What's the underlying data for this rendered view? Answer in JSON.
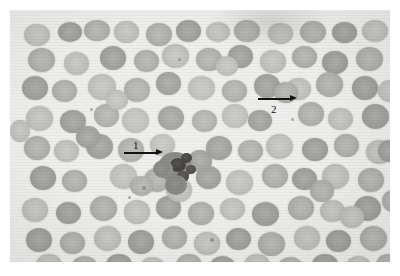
{
  "figure": {
    "kind": "light-micrograph",
    "background_color": "#ffffff",
    "plate": {
      "background_color": "#eeeeec",
      "x": 10,
      "y": 10,
      "width": 380,
      "height": 252
    }
  },
  "annotations": [
    {
      "id": "annotation-1",
      "label": "1",
      "arrow_direction": "right",
      "label_x": 133,
      "label_y": 140,
      "shaft_x": 124,
      "shaft_y": 152,
      "shaft_length": 33,
      "points_to": "dark stained cell cluster"
    },
    {
      "id": "annotation-2",
      "label": "2",
      "arrow_direction": "right",
      "label_x": 271,
      "label_y": 104,
      "shaft_x": 258,
      "shaft_y": 98,
      "shaft_length": 33,
      "points_to": "red blood cell"
    }
  ],
  "cells": {
    "erythrocyte_fill": "#b3b3af",
    "erythrocyte_pale_fill": "#c2c2be",
    "erythrocyte_dark_fill": "#a2a29e",
    "stained_cluster_fill": "#3b3937",
    "count_visible": 118,
    "erythrocytes": [
      {
        "x": 14,
        "y": 14,
        "w": 26,
        "h": 22,
        "v": "pale"
      },
      {
        "x": 48,
        "y": 12,
        "w": 24,
        "h": 20,
        "v": "dark"
      },
      {
        "x": 74,
        "y": 10,
        "w": 26,
        "h": 21,
        "v": ""
      },
      {
        "x": 104,
        "y": 11,
        "w": 25,
        "h": 22,
        "v": "pale"
      },
      {
        "x": 136,
        "y": 13,
        "w": 26,
        "h": 23,
        "v": ""
      },
      {
        "x": 166,
        "y": 10,
        "w": 25,
        "h": 22,
        "v": "dark"
      },
      {
        "x": 196,
        "y": 12,
        "w": 24,
        "h": 20,
        "v": "pale"
      },
      {
        "x": 224,
        "y": 10,
        "w": 26,
        "h": 22,
        "v": ""
      },
      {
        "x": 258,
        "y": 13,
        "w": 25,
        "h": 21,
        "v": "pale"
      },
      {
        "x": 290,
        "y": 11,
        "w": 26,
        "h": 22,
        "v": ""
      },
      {
        "x": 322,
        "y": 12,
        "w": 25,
        "h": 21,
        "v": "dark"
      },
      {
        "x": 352,
        "y": 10,
        "w": 26,
        "h": 22,
        "v": "pale"
      },
      {
        "x": 18,
        "y": 38,
        "w": 27,
        "h": 24,
        "v": ""
      },
      {
        "x": 54,
        "y": 42,
        "w": 25,
        "h": 23,
        "v": "pale"
      },
      {
        "x": 90,
        "y": 36,
        "w": 26,
        "h": 24,
        "v": "dark"
      },
      {
        "x": 124,
        "y": 40,
        "w": 25,
        "h": 22,
        "v": ""
      },
      {
        "x": 152,
        "y": 34,
        "w": 27,
        "h": 24,
        "v": "pale"
      },
      {
        "x": 186,
        "y": 38,
        "w": 26,
        "h": 23,
        "v": ""
      },
      {
        "x": 218,
        "y": 35,
        "w": 25,
        "h": 23,
        "v": "dark"
      },
      {
        "x": 250,
        "y": 40,
        "w": 26,
        "h": 23,
        "v": "pale"
      },
      {
        "x": 282,
        "y": 36,
        "w": 25,
        "h": 22,
        "v": ""
      },
      {
        "x": 312,
        "y": 41,
        "w": 26,
        "h": 23,
        "v": "dark"
      },
      {
        "x": 346,
        "y": 37,
        "w": 27,
        "h": 24,
        "v": ""
      },
      {
        "x": 12,
        "y": 66,
        "w": 26,
        "h": 24,
        "v": "dark"
      },
      {
        "x": 42,
        "y": 70,
        "w": 25,
        "h": 22,
        "v": ""
      },
      {
        "x": 78,
        "y": 64,
        "w": 28,
        "h": 26,
        "v": "pale"
      },
      {
        "x": 114,
        "y": 68,
        "w": 26,
        "h": 24,
        "v": ""
      },
      {
        "x": 146,
        "y": 62,
        "w": 25,
        "h": 23,
        "v": "dark"
      },
      {
        "x": 178,
        "y": 66,
        "w": 27,
        "h": 24,
        "v": "pale"
      },
      {
        "x": 212,
        "y": 70,
        "w": 25,
        "h": 22,
        "v": ""
      },
      {
        "x": 244,
        "y": 64,
        "w": 26,
        "h": 24,
        "v": "dark"
      },
      {
        "x": 276,
        "y": 68,
        "w": 25,
        "h": 22,
        "v": "pale"
      },
      {
        "x": 306,
        "y": 62,
        "w": 27,
        "h": 25,
        "v": ""
      },
      {
        "x": 342,
        "y": 66,
        "w": 26,
        "h": 24,
        "v": "dark"
      },
      {
        "x": 368,
        "y": 70,
        "w": 24,
        "h": 22,
        "v": "pale"
      },
      {
        "x": 16,
        "y": 96,
        "w": 27,
        "h": 25,
        "v": "pale"
      },
      {
        "x": 50,
        "y": 100,
        "w": 26,
        "h": 23,
        "v": "dark"
      },
      {
        "x": 84,
        "y": 94,
        "w": 25,
        "h": 23,
        "v": ""
      },
      {
        "x": 112,
        "y": 98,
        "w": 27,
        "h": 25,
        "v": "pale"
      },
      {
        "x": 148,
        "y": 96,
        "w": 26,
        "h": 24,
        "v": "dark"
      },
      {
        "x": 182,
        "y": 100,
        "w": 25,
        "h": 22,
        "v": ""
      },
      {
        "x": 212,
        "y": 94,
        "w": 26,
        "h": 24,
        "v": "pale"
      },
      {
        "x": 238,
        "y": 100,
        "w": 24,
        "h": 21,
        "v": "dark"
      },
      {
        "x": 288,
        "y": 92,
        "w": 26,
        "h": 24,
        "v": ""
      },
      {
        "x": 318,
        "y": 98,
        "w": 25,
        "h": 22,
        "v": "pale"
      },
      {
        "x": 352,
        "y": 94,
        "w": 27,
        "h": 25,
        "v": "dark"
      },
      {
        "x": 14,
        "y": 126,
        "w": 26,
        "h": 24,
        "v": ""
      },
      {
        "x": 44,
        "y": 130,
        "w": 25,
        "h": 22,
        "v": "pale"
      },
      {
        "x": 76,
        "y": 124,
        "w": 27,
        "h": 25,
        "v": "dark"
      },
      {
        "x": 108,
        "y": 128,
        "w": 26,
        "h": 24,
        "v": ""
      },
      {
        "x": 140,
        "y": 124,
        "w": 25,
        "h": 22,
        "v": "pale"
      },
      {
        "x": 196,
        "y": 126,
        "w": 26,
        "h": 24,
        "v": "dark"
      },
      {
        "x": 228,
        "y": 130,
        "w": 25,
        "h": 22,
        "v": ""
      },
      {
        "x": 256,
        "y": 124,
        "w": 27,
        "h": 25,
        "v": "pale"
      },
      {
        "x": 292,
        "y": 128,
        "w": 26,
        "h": 23,
        "v": "dark"
      },
      {
        "x": 324,
        "y": 124,
        "w": 25,
        "h": 23,
        "v": ""
      },
      {
        "x": 356,
        "y": 130,
        "w": 26,
        "h": 24,
        "v": "pale"
      },
      {
        "x": 20,
        "y": 156,
        "w": 26,
        "h": 24,
        "v": "dark"
      },
      {
        "x": 52,
        "y": 160,
        "w": 25,
        "h": 22,
        "v": ""
      },
      {
        "x": 100,
        "y": 154,
        "w": 27,
        "h": 25,
        "v": "pale"
      },
      {
        "x": 134,
        "y": 158,
        "w": 26,
        "h": 24,
        "v": ""
      },
      {
        "x": 186,
        "y": 156,
        "w": 25,
        "h": 23,
        "v": "dark"
      },
      {
        "x": 216,
        "y": 160,
        "w": 27,
        "h": 25,
        "v": "pale"
      },
      {
        "x": 252,
        "y": 154,
        "w": 26,
        "h": 24,
        "v": ""
      },
      {
        "x": 282,
        "y": 158,
        "w": 25,
        "h": 22,
        "v": "dark"
      },
      {
        "x": 312,
        "y": 154,
        "w": 27,
        "h": 25,
        "v": "pale"
      },
      {
        "x": 348,
        "y": 158,
        "w": 26,
        "h": 24,
        "v": ""
      },
      {
        "x": 12,
        "y": 188,
        "w": 26,
        "h": 24,
        "v": "pale"
      },
      {
        "x": 46,
        "y": 192,
        "w": 25,
        "h": 22,
        "v": "dark"
      },
      {
        "x": 80,
        "y": 186,
        "w": 27,
        "h": 25,
        "v": ""
      },
      {
        "x": 114,
        "y": 190,
        "w": 26,
        "h": 24,
        "v": "pale"
      },
      {
        "x": 146,
        "y": 186,
        "w": 25,
        "h": 23,
        "v": "dark"
      },
      {
        "x": 178,
        "y": 192,
        "w": 26,
        "h": 23,
        "v": ""
      },
      {
        "x": 210,
        "y": 188,
        "w": 25,
        "h": 22,
        "v": "pale"
      },
      {
        "x": 242,
        "y": 192,
        "w": 27,
        "h": 24,
        "v": "dark"
      },
      {
        "x": 278,
        "y": 186,
        "w": 26,
        "h": 24,
        "v": ""
      },
      {
        "x": 310,
        "y": 190,
        "w": 25,
        "h": 22,
        "v": "pale"
      },
      {
        "x": 344,
        "y": 186,
        "w": 27,
        "h": 25,
        "v": "dark"
      },
      {
        "x": 16,
        "y": 218,
        "w": 26,
        "h": 24,
        "v": "dark"
      },
      {
        "x": 50,
        "y": 222,
        "w": 25,
        "h": 22,
        "v": ""
      },
      {
        "x": 84,
        "y": 216,
        "w": 27,
        "h": 25,
        "v": "pale"
      },
      {
        "x": 118,
        "y": 220,
        "w": 26,
        "h": 24,
        "v": "dark"
      },
      {
        "x": 152,
        "y": 216,
        "w": 25,
        "h": 23,
        "v": ""
      },
      {
        "x": 184,
        "y": 222,
        "w": 26,
        "h": 23,
        "v": "pale"
      },
      {
        "x": 216,
        "y": 218,
        "w": 25,
        "h": 22,
        "v": "dark"
      },
      {
        "x": 248,
        "y": 222,
        "w": 27,
        "h": 24,
        "v": ""
      },
      {
        "x": 284,
        "y": 216,
        "w": 26,
        "h": 24,
        "v": "pale"
      },
      {
        "x": 316,
        "y": 220,
        "w": 25,
        "h": 22,
        "v": "dark"
      },
      {
        "x": 350,
        "y": 216,
        "w": 27,
        "h": 25,
        "v": ""
      },
      {
        "x": 26,
        "y": 244,
        "w": 26,
        "h": 22,
        "v": "pale"
      },
      {
        "x": 62,
        "y": 246,
        "w": 25,
        "h": 20,
        "v": ""
      },
      {
        "x": 96,
        "y": 244,
        "w": 26,
        "h": 21,
        "v": "dark"
      },
      {
        "x": 130,
        "y": 247,
        "w": 25,
        "h": 20,
        "v": "pale"
      },
      {
        "x": 166,
        "y": 244,
        "w": 26,
        "h": 22,
        "v": ""
      },
      {
        "x": 200,
        "y": 246,
        "w": 25,
        "h": 20,
        "v": "dark"
      },
      {
        "x": 234,
        "y": 244,
        "w": 26,
        "h": 22,
        "v": "pale"
      },
      {
        "x": 268,
        "y": 247,
        "w": 25,
        "h": 20,
        "v": ""
      },
      {
        "x": 302,
        "y": 244,
        "w": 26,
        "h": 21,
        "v": "dark"
      },
      {
        "x": 336,
        "y": 246,
        "w": 25,
        "h": 20,
        "v": "pale"
      },
      {
        "x": 366,
        "y": 244,
        "w": 24,
        "h": 22,
        "v": ""
      },
      {
        "x": 156,
        "y": 168,
        "w": 26,
        "h": 24,
        "v": "pale"
      },
      {
        "x": 178,
        "y": 140,
        "w": 24,
        "h": 22,
        "v": "dark"
      },
      {
        "x": 120,
        "y": 166,
        "w": 23,
        "h": 20,
        "v": ""
      },
      {
        "x": 66,
        "y": 116,
        "w": 24,
        "h": 22,
        "v": "dark"
      },
      {
        "x": 264,
        "y": 72,
        "w": 24,
        "h": 21,
        "v": ""
      },
      {
        "x": 206,
        "y": 46,
        "w": 22,
        "h": 20,
        "v": "pale"
      },
      {
        "x": 96,
        "y": 80,
        "w": 22,
        "h": 20,
        "v": "pale"
      },
      {
        "x": 300,
        "y": 170,
        "w": 24,
        "h": 22,
        "v": ""
      },
      {
        "x": 330,
        "y": 196,
        "w": 24,
        "h": 22,
        "v": "pale"
      },
      {
        "x": 368,
        "y": 130,
        "w": 22,
        "h": 22,
        "v": "dark"
      },
      {
        "x": 372,
        "y": 180,
        "w": 22,
        "h": 22,
        "v": ""
      },
      {
        "x": 0,
        "y": 110,
        "w": 20,
        "h": 22,
        "v": "pale"
      }
    ],
    "stained_cluster": {
      "center_x": 168,
      "center_y": 155,
      "parts": [
        {
          "x": 148,
          "y": 142,
          "w": 34,
          "h": 30,
          "t": "body"
        },
        {
          "x": 160,
          "y": 148,
          "w": 16,
          "h": 14,
          "t": "nucleus"
        },
        {
          "x": 171,
          "y": 143,
          "w": 11,
          "h": 10,
          "t": "nucleus"
        },
        {
          "x": 167,
          "y": 161,
          "w": 12,
          "h": 11,
          "t": "nucleus2"
        },
        {
          "x": 176,
          "y": 155,
          "w": 10,
          "h": 9,
          "t": "nucleus2"
        },
        {
          "x": 143,
          "y": 150,
          "w": 20,
          "h": 18,
          "t": "body"
        },
        {
          "x": 155,
          "y": 165,
          "w": 22,
          "h": 20,
          "t": "body"
        }
      ]
    },
    "specks": [
      {
        "x": 168,
        "y": 48,
        "w": 3,
        "h": 3
      },
      {
        "x": 80,
        "y": 98,
        "w": 3,
        "h": 3
      },
      {
        "x": 132,
        "y": 176,
        "w": 4,
        "h": 4
      },
      {
        "x": 200,
        "y": 228,
        "w": 4,
        "h": 4
      },
      {
        "x": 281,
        "y": 108,
        "w": 3,
        "h": 3
      },
      {
        "x": 118,
        "y": 186,
        "w": 3,
        "h": 3
      }
    ]
  }
}
